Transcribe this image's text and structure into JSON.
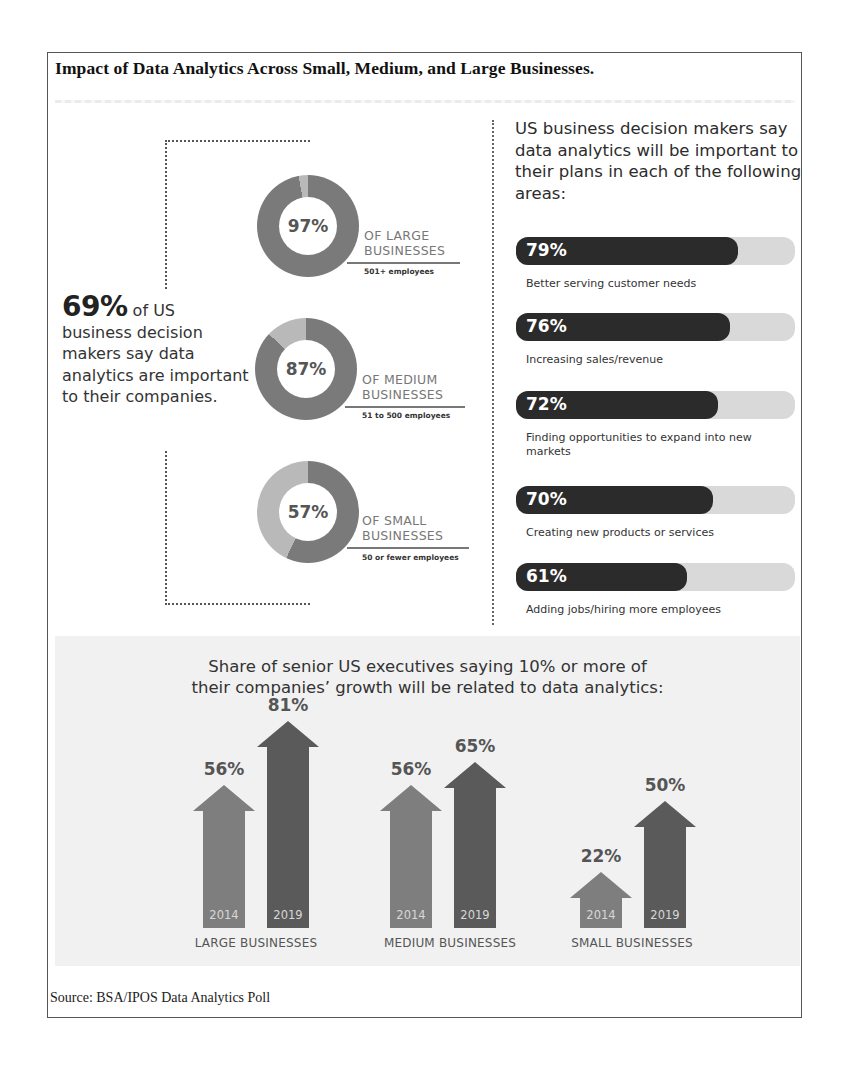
{
  "document": {
    "title": "Impact of Data Analytics Across Small, Medium, and Large Businesses.",
    "source": "Source: BSA/IPOS Data Analytics Poll"
  },
  "headline": {
    "big": "69%",
    "rest_line1": " of US",
    "rest": "business decision makers say data analytics are important to their companies."
  },
  "donuts": [
    {
      "value": "97%",
      "pct": 97,
      "label1": "OF LARGE",
      "label2": "BUSINESSES",
      "sub": "501+ employees"
    },
    {
      "value": "87%",
      "pct": 87,
      "label1": "OF MEDIUM",
      "label2": "BUSINESSES",
      "sub": "51 to 500 employees"
    },
    {
      "value": "57%",
      "pct": 57,
      "label1": "OF SMALL",
      "label2": "BUSINESSES",
      "sub": "50 or fewer employees"
    }
  ],
  "right": {
    "heading": "US business decision makers say data analytics will be important to their plans in each of the following areas:",
    "bars": [
      {
        "value": "79%",
        "pct": 79,
        "label": "Better serving customer needs"
      },
      {
        "value": "76%",
        "pct": 76,
        "label": "Increasing sales/revenue"
      },
      {
        "value": "72%",
        "pct": 72,
        "label": "Finding opportunities to expand into new markets"
      },
      {
        "value": "70%",
        "pct": 70,
        "label": "Creating new products or services"
      },
      {
        "value": "61%",
        "pct": 61,
        "label": "Adding jobs/hiring more employees"
      }
    ]
  },
  "growth": {
    "title_line1": "Share of senior US executives saying 10% or more of",
    "title_line2": "their companies’ growth will be related to data analytics:",
    "groups": [
      {
        "label": "LARGE BUSINESSES",
        "arrows": [
          {
            "year": "2014",
            "value": "56%"
          },
          {
            "year": "2019",
            "value": "81%"
          }
        ]
      },
      {
        "label": "MEDIUM BUSINESSES",
        "arrows": [
          {
            "year": "2014",
            "value": "56%"
          },
          {
            "year": "2019",
            "value": "65%"
          }
        ]
      },
      {
        "label": "SMALL BUSINESSES",
        "arrows": [
          {
            "year": "2014",
            "value": "22%"
          },
          {
            "year": "2019",
            "value": "50%"
          }
        ]
      }
    ]
  },
  "colors": {
    "donut_main": "#7a7a7a",
    "donut_rest": "#b9b9b9",
    "bar_fill": "#2b2b2b",
    "bar_track": "#d9d9d9",
    "arrow_2014": "#7e7e7e",
    "arrow_2019": "#5a5a5a"
  },
  "chart_data": [
    {
      "type": "pie",
      "title": "Share of US businesses where decision makers say data analytics are important",
      "categories": [
        "Large businesses (501+ employees)",
        "Medium businesses (51 to 500 employees)",
        "Small businesses (50 or fewer employees)"
      ],
      "values": [
        97,
        87,
        57
      ],
      "unit": "%",
      "style": "donut"
    },
    {
      "type": "bar",
      "orientation": "horizontal",
      "title": "US business decision makers say data analytics will be important to their plans in each of the following areas:",
      "categories": [
        "Better serving customer needs",
        "Increasing sales/revenue",
        "Finding opportunities to expand into new markets",
        "Creating new products or services",
        "Adding jobs/hiring more employees"
      ],
      "values": [
        79,
        76,
        72,
        70,
        61
      ],
      "ylim": [
        0,
        100
      ],
      "unit": "%"
    },
    {
      "type": "bar",
      "title": "Share of senior US executives saying 10% or more of their companies' growth will be related to data analytics:",
      "categories": [
        "LARGE BUSINESSES",
        "MEDIUM BUSINESSES",
        "SMALL BUSINESSES"
      ],
      "series": [
        {
          "name": "2014",
          "values": [
            56,
            56,
            22
          ]
        },
        {
          "name": "2019",
          "values": [
            81,
            65,
            50
          ]
        }
      ],
      "unit": "%",
      "style": "arrows"
    }
  ]
}
